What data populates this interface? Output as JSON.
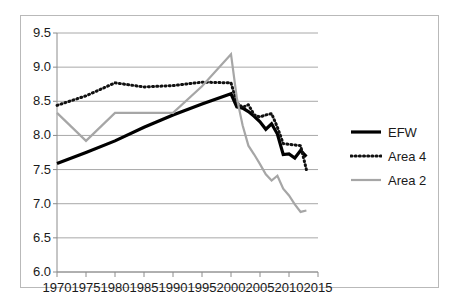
{
  "chart_data": {
    "type": "line",
    "title": "",
    "subtitle": "",
    "xlabel": "",
    "ylabel": "",
    "xlim": [
      1970,
      2015
    ],
    "ylim": [
      6.0,
      9.5
    ],
    "grid": true,
    "grid_axis": "y",
    "legend_position": "right",
    "yticks": [
      "9.5",
      "9.0",
      "8.5",
      "8.0",
      "7.5",
      "7.0",
      "6.5",
      "6.0"
    ],
    "ytick_values": [
      9.5,
      9.0,
      8.5,
      8.0,
      7.5,
      7.0,
      6.5,
      6.0
    ],
    "xticks": [
      "1970",
      "1975",
      "1980",
      "1985",
      "1990",
      "1995",
      "2000",
      "2005",
      "2010",
      "2015"
    ],
    "xtick_values": [
      1970,
      1975,
      1980,
      1985,
      1990,
      1995,
      2000,
      2005,
      2010,
      2015
    ],
    "series": [
      {
        "name": "EFW",
        "color": "#000000",
        "style": "solid",
        "width": 3.2,
        "x": [
          1970,
          1975,
          1980,
          1985,
          1990,
          1995,
          2000,
          2001,
          2002,
          2003,
          2004,
          2005,
          2006,
          2007,
          2008,
          2009,
          2010,
          2011,
          2012,
          2013
        ],
        "values": [
          7.59,
          7.75,
          7.92,
          8.12,
          8.3,
          8.46,
          8.61,
          8.42,
          8.4,
          8.35,
          8.28,
          8.2,
          8.09,
          8.17,
          8.02,
          7.72,
          7.73,
          7.67,
          7.78,
          7.69
        ]
      },
      {
        "name": "Area 4",
        "color": "#111111",
        "style": "dotted",
        "width": 3.0,
        "x": [
          1970,
          1975,
          1980,
          1985,
          1990,
          1995,
          2000,
          2001,
          2002,
          2003,
          2004,
          2005,
          2006,
          2007,
          2008,
          2009,
          2010,
          2011,
          2012,
          2013
        ],
        "values": [
          8.44,
          8.58,
          8.77,
          8.71,
          8.73,
          8.78,
          8.77,
          8.48,
          8.41,
          8.45,
          8.3,
          8.27,
          8.3,
          8.32,
          8.12,
          7.88,
          7.87,
          7.86,
          7.85,
          7.5
        ]
      },
      {
        "name": "Area 2",
        "color": "#a6a6a6",
        "style": "solid",
        "width": 2.2,
        "x": [
          1970,
          1975,
          1980,
          1985,
          1990,
          1995,
          2000,
          2001,
          2002,
          2003,
          2004,
          2005,
          2006,
          2007,
          2008,
          2009,
          2010,
          2011,
          2012,
          2013
        ],
        "values": [
          8.33,
          7.92,
          8.33,
          8.33,
          8.33,
          8.72,
          9.19,
          8.55,
          8.15,
          7.85,
          7.72,
          7.58,
          7.43,
          7.34,
          7.41,
          7.22,
          7.12,
          6.99,
          6.88,
          6.9
        ]
      }
    ]
  },
  "legend": {
    "items": [
      {
        "label": "EFW",
        "icon": "solid-line-swatch"
      },
      {
        "label": "Area 4",
        "icon": "dotted-line-swatch"
      },
      {
        "label": "Area 2",
        "icon": "gray-line-swatch"
      }
    ]
  },
  "colors": {
    "efw": "#000000",
    "area4": "#111111",
    "area2": "#a6a6a6",
    "gridline": "#a8a8a8",
    "axis": "#8c8c8c",
    "frame": "#b9b9b9",
    "text": "#1a1a1a",
    "background": "#ffffff"
  }
}
